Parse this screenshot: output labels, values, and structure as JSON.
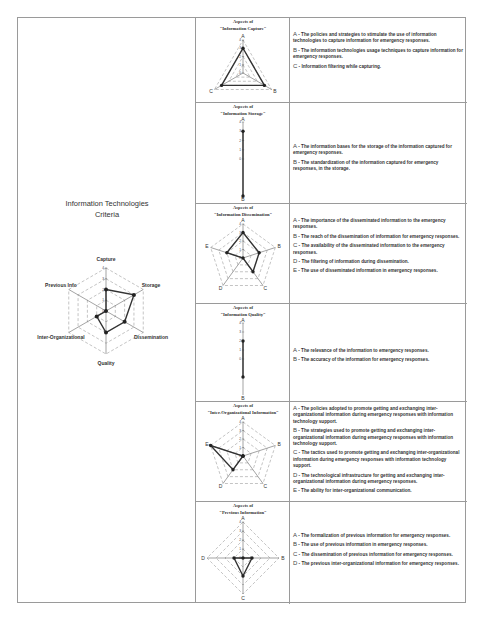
{
  "left": {
    "title_line1": "Information Technologies",
    "title_line2": "Criteria"
  },
  "chart_data": [
    {
      "type": "radar",
      "title": "Information Technologies Criteria",
      "categories": [
        "Capture",
        "Storage",
        "Dissemination",
        "Quality",
        "Inter-Organizational",
        "Previous Info"
      ],
      "values": [
        2,
        3,
        2,
        2,
        1,
        0
      ],
      "rlim": [
        0,
        4
      ],
      "ticks": [
        0,
        1,
        2,
        3,
        4
      ],
      "grid": "dashed"
    },
    {
      "type": "radar",
      "title": "Aspects of \"Information Capture\"",
      "categories": [
        "A",
        "B",
        "C"
      ],
      "values": [
        3,
        3,
        3
      ],
      "rlim": [
        0,
        4
      ],
      "ticks": [
        0,
        1,
        2,
        3,
        4
      ]
    },
    {
      "type": "radar",
      "title": "Aspects of \"Information Storage\"",
      "categories": [
        "A",
        "B"
      ],
      "values": [
        3,
        4
      ],
      "rlim": [
        0,
        4
      ],
      "ticks": [
        0,
        1,
        2,
        3,
        4
      ]
    },
    {
      "type": "radar",
      "title": "Aspects of \"Information Dissemination\"",
      "categories": [
        "A",
        "B",
        "C",
        "D",
        "E"
      ],
      "values": [
        3,
        2,
        2,
        0,
        2
      ],
      "rlim": [
        0,
        4
      ],
      "ticks": [
        0,
        1,
        2,
        3,
        4
      ]
    },
    {
      "type": "radar",
      "title": "Aspects of \"Information Quality\"",
      "categories": [
        "A",
        "B"
      ],
      "values": [
        2,
        2
      ],
      "rlim": [
        0,
        4
      ],
      "ticks": [
        0,
        1,
        2,
        3,
        4
      ]
    },
    {
      "type": "radar",
      "title": "Aspects of \"Inter-Organizational Information\"",
      "categories": [
        "A",
        "B",
        "C",
        "D",
        "E"
      ],
      "values": [
        0,
        0,
        0,
        2,
        4
      ],
      "rlim": [
        0,
        4
      ],
      "ticks": [
        0,
        1,
        2,
        3,
        4
      ]
    },
    {
      "type": "radar",
      "title": "Aspects of \"Previous Information\"",
      "categories": [
        "A",
        "B",
        "C",
        "D"
      ],
      "values": [
        0,
        1,
        2,
        1
      ],
      "rlim": [
        0,
        4
      ],
      "ticks": [
        0,
        1,
        2,
        3,
        4
      ]
    }
  ],
  "rows": [
    {
      "title1": "Aspects of",
      "title2": "\"Information Capture\"",
      "items": [
        {
          "key": "A",
          "text": " - The policies and strategies to stimulate the use of information technologies to capture information for emergency responses."
        },
        {
          "key": "B",
          "text": " - The information technologies usage techniques to capture information for emergency responses."
        },
        {
          "key": "C",
          "text": " - Information filtering while capturing."
        }
      ]
    },
    {
      "title1": "Aspects of",
      "title2": "\"Information Storage\"",
      "items": [
        {
          "key": "A",
          "text": " - The information bases for the storage of the information captured for emergency responses."
        },
        {
          "key": "B",
          "text": " - The standardization of the information captured for emergency responses, in the storage."
        }
      ]
    },
    {
      "title1": "Aspects of",
      "title2": "\"Information Dissemination\"",
      "items": [
        {
          "key": "A",
          "text": " - The importance of the disseminated information to the emergency responses."
        },
        {
          "key": "B",
          "text": " - The reach of the dissemination of information for emergency responses."
        },
        {
          "key": "C",
          "text": " - The availability of the disseminated information to the emergency responses."
        },
        {
          "key": "D",
          "text": " - The filtering of information during dissemination."
        },
        {
          "key": "E",
          "text": " - The use of disseminated information in emergency responses."
        }
      ]
    },
    {
      "title1": "Aspects of",
      "title2": "\"Information Quality\"",
      "items": [
        {
          "key": "A",
          "text": " - The relevance of the information to emergency responses."
        },
        {
          "key": "B",
          "text": " - The accuracy of the information for emergency responses."
        }
      ]
    },
    {
      "title1": "Aspects of",
      "title2": "\"Inter-Organizational Information\"",
      "items": [
        {
          "key": "A",
          "text": " - The policies adopted to promote getting and exchanging inter-organizational information during emergency responses with information technology support."
        },
        {
          "key": "B",
          "text": " - The strategies used to promote getting and exchanging inter-organizational information during emergency responses with information technology support."
        },
        {
          "key": "C",
          "text": " - The tactics used to promote getting and exchanging inter-organizational information during emergency responses with information technology support."
        },
        {
          "key": "D",
          "text": " - The technological infrastructure for getting and exchanging inter-organizational information during emergency responses."
        },
        {
          "key": "E",
          "text": " - The ability for inter-organizational communication."
        }
      ]
    },
    {
      "title1": "Aspects of",
      "title2": "\"Previous Information\"",
      "items": [
        {
          "key": "A",
          "text": " - The formalization of previous information for emergency responses."
        },
        {
          "key": "B",
          "text": " - The use of previous information in emergency responses."
        },
        {
          "key": "C",
          "text": " - The dissemination of previous information for emergency responses."
        },
        {
          "key": "D",
          "text": " - The previous inter-organizational information for emergency responses."
        }
      ]
    }
  ]
}
